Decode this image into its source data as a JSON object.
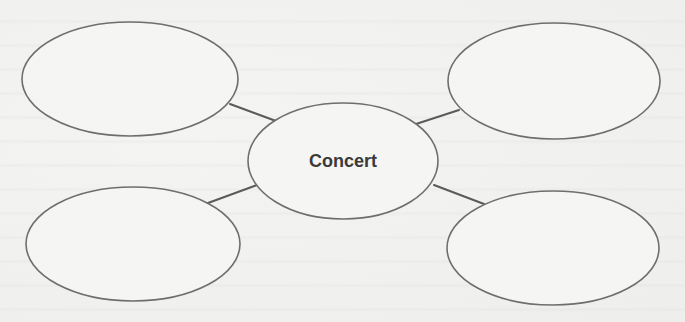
{
  "diagram": {
    "type": "concept-web",
    "center": {
      "label": "Concert",
      "cx": 343,
      "cy": 161,
      "rx": 95,
      "ry": 58
    },
    "satellites": [
      {
        "position": "top-left",
        "label": "",
        "cx": 130,
        "cy": 79,
        "rx": 108,
        "ry": 57
      },
      {
        "position": "top-right",
        "label": "",
        "cx": 554,
        "cy": 81,
        "rx": 106,
        "ry": 58
      },
      {
        "position": "bottom-left",
        "label": "",
        "cx": 133,
        "cy": 244,
        "rx": 107,
        "ry": 57
      },
      {
        "position": "bottom-right",
        "label": "",
        "cx": 553,
        "cy": 248,
        "rx": 106,
        "ry": 57
      }
    ],
    "connectors": [
      {
        "from": "top-left",
        "x1": 230,
        "y1": 104,
        "x2": 276,
        "y2": 121
      },
      {
        "from": "top-right",
        "x1": 459,
        "y1": 110,
        "x2": 416,
        "y2": 124
      },
      {
        "from": "bottom-left",
        "x1": 208,
        "y1": 203,
        "x2": 257,
        "y2": 185
      },
      {
        "from": "bottom-right",
        "x1": 484,
        "y1": 204,
        "x2": 434,
        "y2": 185
      }
    ],
    "colors": {
      "background": "#f1f1ef",
      "stroke": "#6e6e6e",
      "text": "#3a3a3a"
    }
  }
}
